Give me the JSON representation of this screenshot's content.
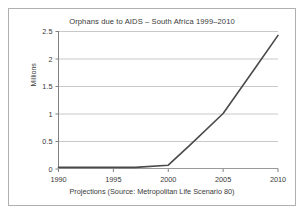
{
  "figure": {
    "title": "Orphans due to AIDS – South Africa 1999–2010",
    "caption": "Projections (Source: Metropolitan Life Scenario 80)",
    "border_color": "#b0b0b0",
    "background": "#ffffff"
  },
  "chart_data": {
    "type": "line",
    "title": "Orphans due to AIDS – South Africa 1999–2010",
    "subtitle": "",
    "xlabel": "Projections (Source: Metropolitan Life Scenario 80)",
    "ylabel": "Millions",
    "xlim": [
      1990,
      2010
    ],
    "ylim": [
      0,
      2.5
    ],
    "grid": "horizontal",
    "legend": "none",
    "xticks": [
      "1990",
      "1995",
      "2000",
      "2005",
      "2010"
    ],
    "xtick_values": [
      1990,
      1995,
      2000,
      2005,
      2010
    ],
    "yticks": [
      "0",
      "0.5",
      "1",
      "1.5",
      "2",
      "2.5"
    ],
    "ytick_values": [
      0,
      0.5,
      1,
      1.5,
      2,
      2.5
    ],
    "line_color": "#4a4a4a",
    "grid_color": "#c8c8c8",
    "axis_color": "#808080",
    "series": [
      {
        "name": "Orphans due to AIDS",
        "x": [
          1990,
          1995,
          1997,
          2000,
          2002,
          2005,
          2008,
          2010
        ],
        "values": [
          0.02,
          0.02,
          0.02,
          0.06,
          0.43,
          1.0,
          1.85,
          2.42
        ]
      }
    ]
  }
}
